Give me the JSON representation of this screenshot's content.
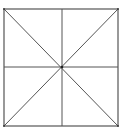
{
  "diagram": {
    "stroke_color": "#555555",
    "center_dot_color": "#222222",
    "square": {
      "x1": 4,
      "y1": 9,
      "x2": 118,
      "y2": 126
    },
    "center": {
      "x": 62,
      "y": 67
    }
  }
}
